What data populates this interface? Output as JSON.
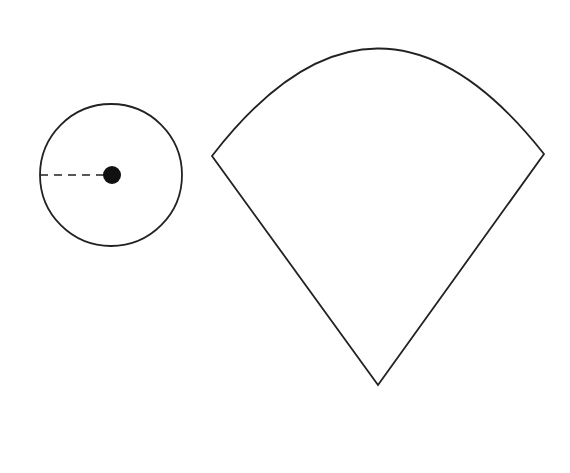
{
  "diagram": {
    "background": "#ffffff",
    "stroke_color": "#222222",
    "circle": {
      "cx": 111,
      "cy": 175,
      "r": 71,
      "center_dot": {
        "cx": 112,
        "cy": 175,
        "r": 9
      },
      "radius_line": {
        "x1": 40,
        "y1": 175,
        "x2": 104,
        "y2": 175,
        "style": "dashed"
      }
    },
    "sector": {
      "apex": [
        378,
        385
      ],
      "left_corner": [
        212,
        156
      ],
      "right_corner": [
        544,
        154
      ],
      "arc_top": [
        377,
        49
      ]
    }
  }
}
